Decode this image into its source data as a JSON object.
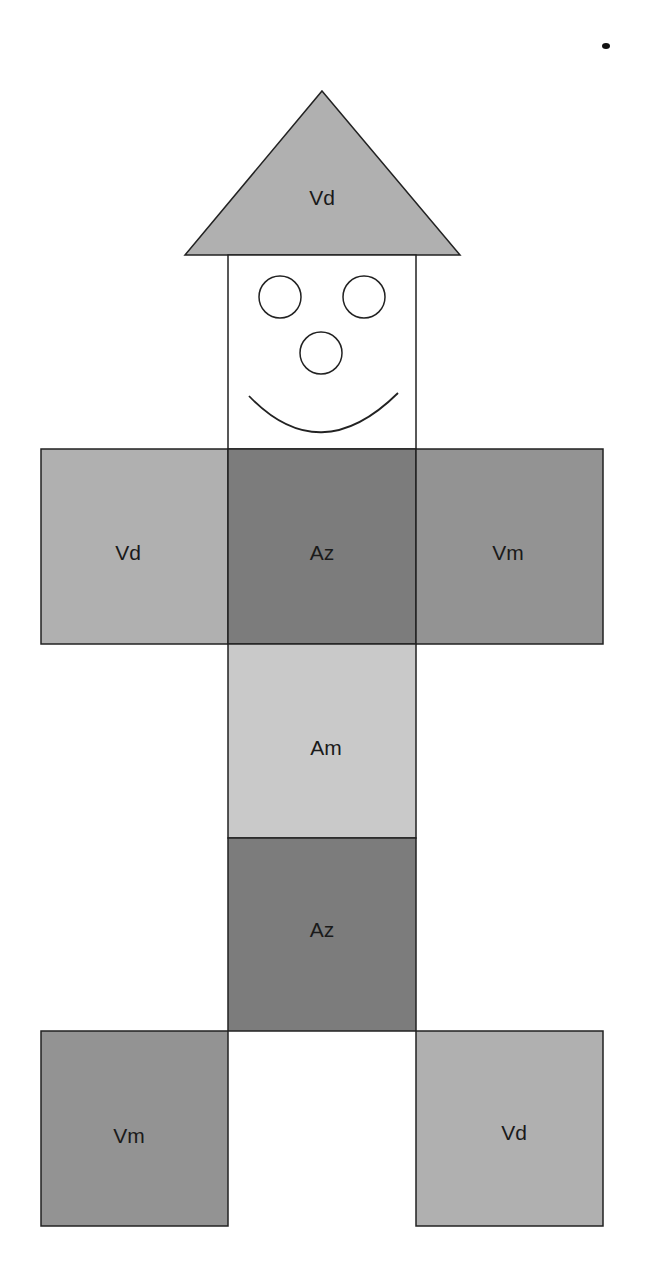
{
  "diagram": {
    "colors": {
      "Vd": "#b0b0b0",
      "Az": "#7c7c7c",
      "Vm": "#939393",
      "Am": "#c9c9c9",
      "stroke": "#222222",
      "face": "#ffffff"
    },
    "hat": {
      "label": "Vd"
    },
    "face": {
      "parts": [
        "left-eye",
        "right-eye",
        "nose",
        "smile"
      ]
    },
    "arms_row": [
      {
        "label": "Vd"
      },
      {
        "label": "Az"
      },
      {
        "label": "Vm"
      }
    ],
    "body_column": [
      {
        "label": "Am"
      },
      {
        "label": "Az"
      }
    ],
    "legs": [
      {
        "label": "Vm"
      },
      {
        "label": "Vd"
      }
    ]
  }
}
